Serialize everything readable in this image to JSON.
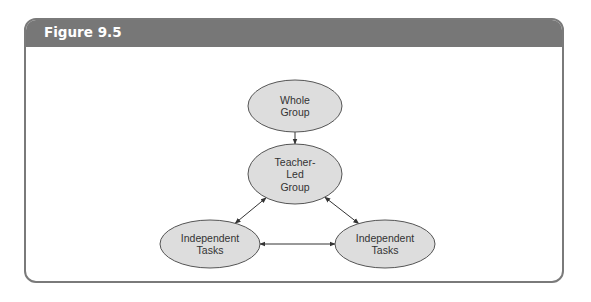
{
  "figure": {
    "title": "Figure 9.5",
    "colors": {
      "header": "#777777",
      "node_fill": "#dddddd",
      "stroke": "#555555"
    }
  },
  "diagram": {
    "nodes": [
      {
        "id": "whole-group",
        "lines": [
          "Whole",
          "Group"
        ]
      },
      {
        "id": "teacher-led-group",
        "lines": [
          "Teacher-",
          "Led",
          "Group"
        ]
      },
      {
        "id": "independent-tasks-left",
        "lines": [
          "Independent",
          "Tasks"
        ]
      },
      {
        "id": "independent-tasks-right",
        "lines": [
          "Independent",
          "Tasks"
        ]
      }
    ],
    "edges": [
      {
        "from": "whole-group",
        "to": "teacher-led-group",
        "direction": "one-way"
      },
      {
        "from": "teacher-led-group",
        "to": "independent-tasks-left",
        "direction": "two-way"
      },
      {
        "from": "teacher-led-group",
        "to": "independent-tasks-right",
        "direction": "two-way"
      },
      {
        "from": "independent-tasks-left",
        "to": "independent-tasks-right",
        "direction": "two-way"
      }
    ]
  }
}
